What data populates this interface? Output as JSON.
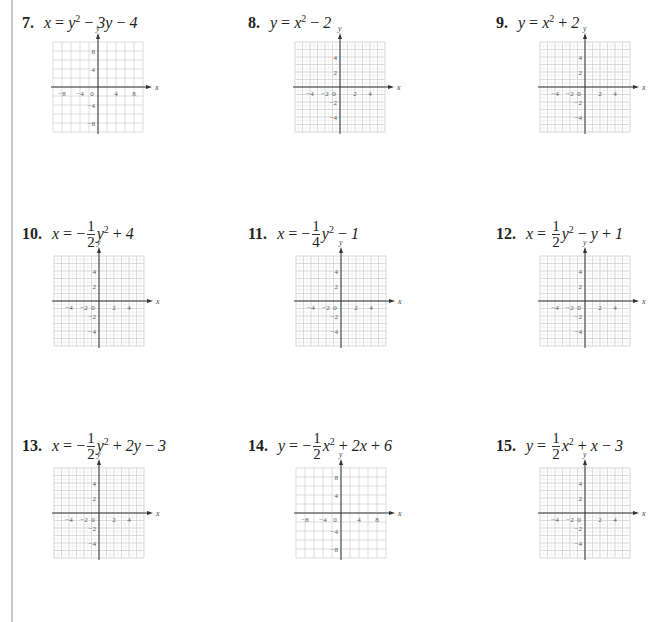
{
  "problems": [
    {
      "number": "7.",
      "equation_text": "x = y² − 3y − 4",
      "parts": {
        "lhs": "x",
        "frac": null,
        "rest": "y",
        "sup": "2",
        "tail": " − 3y − 4"
      },
      "range": 10,
      "step": 2,
      "labels": [
        "−8",
        "−4",
        "0",
        "4",
        "8"
      ],
      "ylabels": [
        "8",
        "4",
        "−4",
        "−8"
      ]
    },
    {
      "number": "8.",
      "equation_text": "y = x² − 2",
      "parts": {
        "lhs": "y",
        "frac": null,
        "rest": "x",
        "sup": "2",
        "tail": " − 2"
      },
      "range": 6,
      "step": 1,
      "labels": [
        "−4",
        "−2",
        "0",
        "2",
        "4"
      ],
      "ylabels": [
        "4",
        "2",
        "−2",
        "−4"
      ]
    },
    {
      "number": "9.",
      "equation_text": "y = x² + 2",
      "parts": {
        "lhs": "y",
        "frac": null,
        "rest": "x",
        "sup": "2",
        "tail": " + 2"
      },
      "range": 6,
      "step": 1,
      "labels": [
        "−4",
        "−2",
        "0",
        "2",
        "4"
      ],
      "ylabels": [
        "4",
        "2",
        "−2",
        "−4"
      ]
    },
    {
      "number": "10.",
      "equation_text": "x = −(1/2)y² + 4",
      "parts": {
        "lhs": "x",
        "sign": "−",
        "num": "1",
        "den": "2",
        "rest": "y",
        "sup": "2",
        "tail": " + 4"
      },
      "range": 6,
      "step": 1,
      "labels": [
        "−4",
        "−2",
        "0",
        "2",
        "4"
      ],
      "ylabels": [
        "4",
        "2",
        "−2",
        "−4"
      ]
    },
    {
      "number": "11.",
      "equation_text": "x = −(1/4)y² − 1",
      "parts": {
        "lhs": "x",
        "sign": "−",
        "num": "1",
        "den": "4",
        "rest": "y",
        "sup": "2",
        "tail": " − 1"
      },
      "range": 6,
      "step": 1,
      "labels": [
        "−4",
        "−2",
        "0",
        "2",
        "4"
      ],
      "ylabels": [
        "4",
        "2",
        "−2",
        "−4"
      ]
    },
    {
      "number": "12.",
      "equation_text": "x = (1/2)y² − y + 1",
      "parts": {
        "lhs": "x",
        "sign": "",
        "num": "1",
        "den": "2",
        "rest": "y",
        "sup": "2",
        "tail": " − y + 1"
      },
      "range": 6,
      "step": 1,
      "labels": [
        "−4",
        "−2",
        "0",
        "2",
        "4"
      ],
      "ylabels": [
        "4",
        "2",
        "−2",
        "−4"
      ]
    },
    {
      "number": "13.",
      "equation_text": "x = −(1/2)y² + 2y − 3",
      "parts": {
        "lhs": "x",
        "sign": "−",
        "num": "1",
        "den": "2",
        "rest": "y",
        "sup": "2",
        "tail": " + 2y − 3"
      },
      "range": 6,
      "step": 1,
      "labels": [
        "−4",
        "−2",
        "0",
        "2",
        "4"
      ],
      "ylabels": [
        "4",
        "2",
        "−2",
        "−4"
      ]
    },
    {
      "number": "14.",
      "equation_text": "y = −(1/2)x² + 2x + 6",
      "parts": {
        "lhs": "y",
        "sign": "−",
        "num": "1",
        "den": "2",
        "rest": "x",
        "sup": "2",
        "tail": " + 2x + 6"
      },
      "range": 10,
      "step": 2,
      "labels": [
        "−8",
        "−4",
        "0",
        "4",
        "8"
      ],
      "ylabels": [
        "8",
        "4",
        "−4",
        "−8"
      ]
    },
    {
      "number": "15.",
      "equation_text": "y = (1/2)x² + x − 3",
      "parts": {
        "lhs": "y",
        "sign": "",
        "num": "1",
        "den": "2",
        "rest": "x",
        "sup": "2",
        "tail": " + x − 3"
      },
      "range": 6,
      "step": 1,
      "labels": [
        "−4",
        "−2",
        "0",
        "2",
        "4"
      ],
      "ylabels": [
        "4",
        "2",
        "−2",
        "−4"
      ]
    }
  ],
  "axis": {
    "x_label": "x",
    "y_label": "y"
  },
  "layout": {
    "label_pos": [
      [
        22,
        10
      ],
      [
        248,
        10
      ],
      [
        496,
        10
      ],
      [
        22,
        222
      ],
      [
        248,
        222
      ],
      [
        496,
        222
      ],
      [
        22,
        434
      ],
      [
        248,
        434
      ],
      [
        496,
        434
      ]
    ],
    "grid_pos": [
      [
        53,
        42
      ],
      [
        295,
        42
      ],
      [
        540,
        42
      ],
      [
        54,
        256
      ],
      [
        296,
        256
      ],
      [
        540,
        256
      ],
      [
        54,
        468
      ],
      [
        296,
        468
      ],
      [
        540,
        468
      ]
    ],
    "grid_size": 90
  }
}
